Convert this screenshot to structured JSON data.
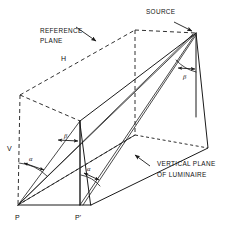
{
  "diagram": {
    "canvas": {
      "width": 225,
      "height": 227,
      "background": "#ffffff"
    },
    "line_color": "#1a1a1a",
    "labels": {
      "source": "SOURCE",
      "reference_plane_line1": "REFERENCE",
      "reference_plane_line2": "PLANE",
      "vertical_plane_line1": "VERTICAL PLANE",
      "vertical_plane_line2": "OF LUMINAIRE",
      "h": "H",
      "v": "V",
      "p": "P",
      "p_prime": "P'",
      "alpha_left": "α",
      "alpha_lower": "α",
      "beta_left": "β",
      "beta_right": "β"
    },
    "points": {
      "source": {
        "x": 196,
        "y": 33,
        "name": "SOURCE"
      },
      "p": {
        "x": 18,
        "y": 205,
        "name": "P"
      },
      "p_prime": {
        "x": 80,
        "y": 205,
        "name": "P'"
      },
      "vplane_top_left": {
        "x": 80,
        "y": 121,
        "name": "vertical-plane-top-left"
      },
      "vplane_top_right": {
        "x": 196,
        "y": 33,
        "name": "vertical-plane-top-right"
      },
      "vplane_bottom_right": {
        "x": 196,
        "y": 117,
        "name": "vertical-plane-bottom-right"
      },
      "vplane_bottom_far": {
        "x": 208,
        "y": 148,
        "name": "vertical-plane-bottom-far"
      },
      "refplane_left": {
        "x": 20,
        "y": 95,
        "name": "reference-plane-left"
      },
      "refplane_top_mid": {
        "x": 135,
        "y": 30,
        "name": "reference-plane-top-mid"
      },
      "refplane_foot_mid": {
        "x": 135,
        "y": 135,
        "name": "reference-plane-foot-mid"
      }
    },
    "annotations": [
      {
        "name": "source-leader",
        "from": {
          "x": 174,
          "y": 22
        },
        "to": {
          "x": 192,
          "y": 32
        }
      },
      {
        "name": "reference-plane-leader",
        "from": {
          "x": 75,
          "y": 26
        },
        "to": {
          "x": 97,
          "y": 41
        }
      },
      {
        "name": "vertical-plane-leader",
        "from": {
          "x": 151,
          "y": 167
        },
        "to": {
          "x": 135,
          "y": 155
        }
      }
    ]
  }
}
